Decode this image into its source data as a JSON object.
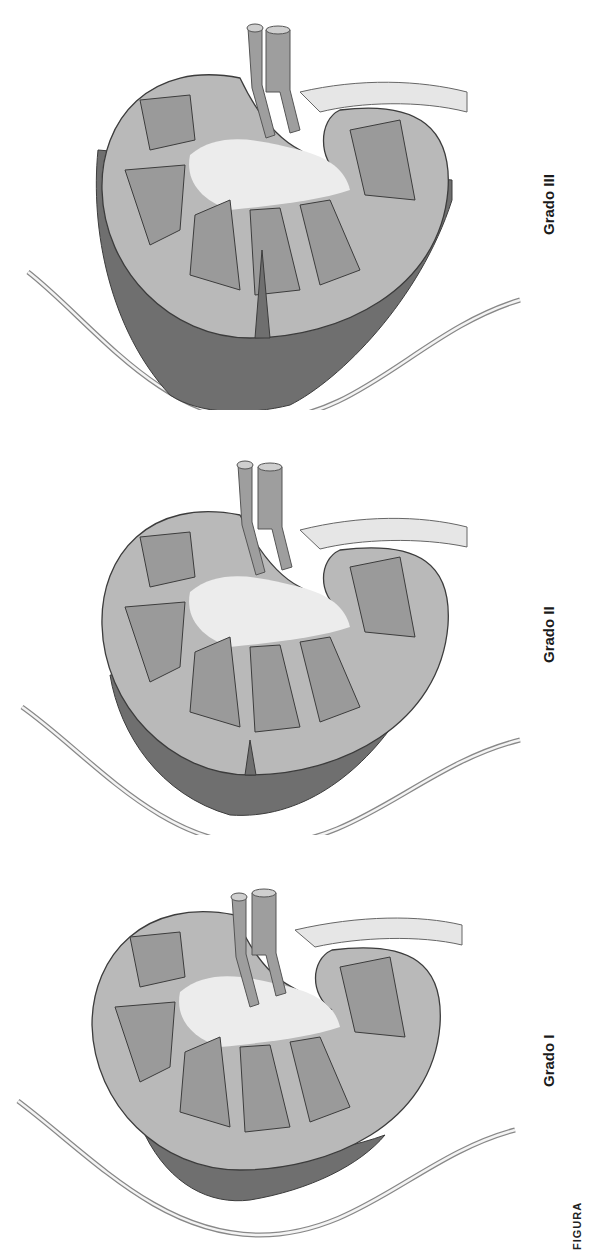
{
  "figure": {
    "caption_fragment": "FIGURA",
    "panels": [
      {
        "label": "Grado III",
        "hematoma": "large subcapsular/perirenal hematoma with deep cortical laceration"
      },
      {
        "label": "Grado II",
        "hematoma": "perirenal hematoma with superficial cortical laceration"
      },
      {
        "label": "Grado I",
        "hematoma": "small subcapsular hematoma, no laceration"
      }
    ],
    "colors": {
      "cortex": "#b9b9b9",
      "pyramids": "#9a9a9a",
      "sinus": "#ececec",
      "hematoma": "#6f6f6f",
      "outline": "#3c3c3c",
      "capsule_line": "#8a8a8a"
    }
  }
}
